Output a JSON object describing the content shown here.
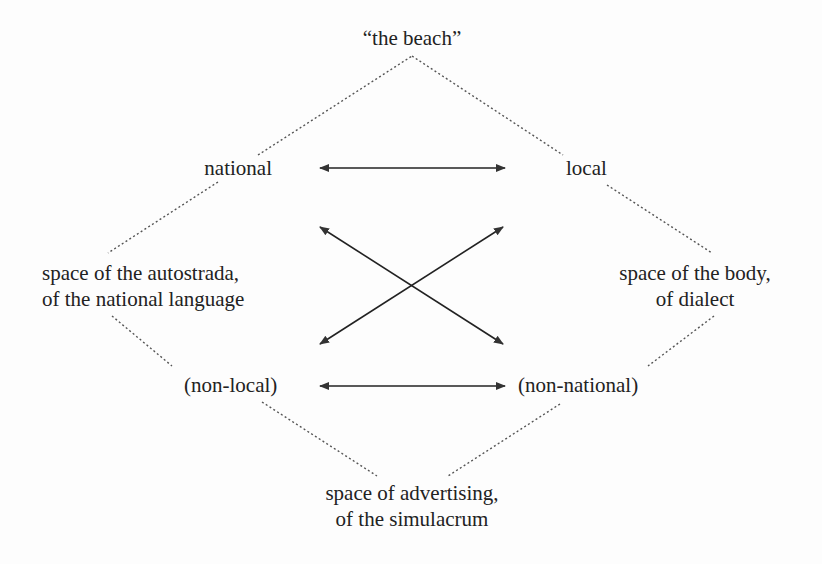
{
  "diagram": {
    "nodes": {
      "apex": "“the beach”",
      "national": "national",
      "local": "local",
      "autostrada_line1": "space of the autostrada,",
      "autostrada_line2": "of the national language",
      "body_line1": "space of the body,",
      "body_line2": "of dialect",
      "non_local": "(non-local)",
      "non_national": "(non-national)",
      "advertising_line1": "space of advertising,",
      "advertising_line2": "of the simulacrum"
    },
    "edges": {
      "dotted": [
        "“the beach” – national",
        "“the beach” – local",
        "national – space of the autostrada",
        "local – space of the body",
        "space of the autostrada – (non-local)",
        "space of the body – (non-national)",
        "(non-local) – space of advertising",
        "(non-national) – space of advertising"
      ],
      "double_arrows": [
        "national ↔ local",
        "(non-local) ↔ (non-national)",
        "national ↔ (non-national)",
        "local ↔ (non-local)"
      ]
    },
    "colors": {
      "text": "#222222",
      "lines": "#333333",
      "background": "#fdfdfd"
    }
  }
}
